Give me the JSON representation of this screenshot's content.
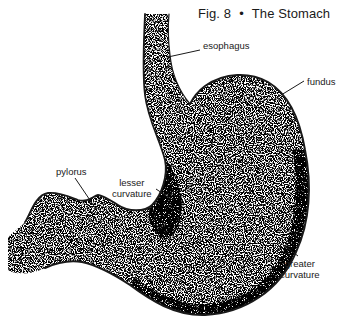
{
  "figure": {
    "number_label": "Fig. 8",
    "separator": "•",
    "title": "The Stomach"
  },
  "labels": {
    "esophagus": "esophagus",
    "fundus": "fundus",
    "pylorus": "pylorus",
    "lesser_curvature_line1": "lesser",
    "lesser_curvature_line2": "curvature",
    "greater_curvature_line1": "greater",
    "greater_curvature_line2": "curvature"
  },
  "colors": {
    "ink": "#1a1a1a",
    "background": "#ffffff"
  }
}
